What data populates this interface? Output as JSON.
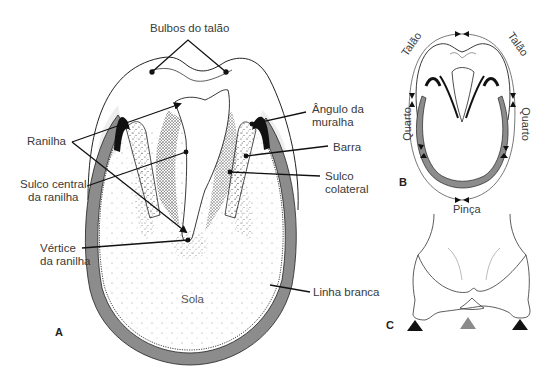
{
  "figure": {
    "panels": {
      "a": {
        "letter": "A",
        "labels": {
          "bulbos": "Bulbos do talão",
          "ranilha": "Ranilha",
          "sulco_central_1": "Sulco central",
          "sulco_central_2": "da ranilha",
          "vertice_1": "Vértice",
          "vertice_2": "da ranilha",
          "angulo_1": "Ângulo da",
          "angulo_2": "muralha",
          "barra": "Barra",
          "sulco_colateral_1": "Sulco",
          "sulco_colateral_2": "colateral",
          "sola": "Sola",
          "linha_branca": "Linha branca"
        }
      },
      "b": {
        "letter": "B",
        "labels": {
          "talao_left": "Talão",
          "talao_right": "Talão",
          "quarto_left": "Quarto",
          "quarto_right": "Quarto",
          "pinca": "Pinça"
        }
      },
      "c": {
        "letter": "C",
        "markers": [
          "black-triangle",
          "gray-triangle",
          "black-triangle"
        ]
      }
    },
    "colors": {
      "wall_gray": "#8c8c8c",
      "line": "#1a1a1a",
      "marker_black": "#111111",
      "marker_gray": "#8a8a8a"
    }
  }
}
